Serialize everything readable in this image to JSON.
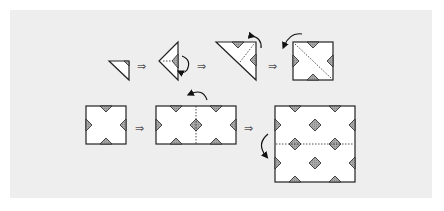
{
  "diagram": {
    "type": "origami-fold-sequence",
    "background_color": "#eeeeee",
    "paper_color": "#ffffff",
    "stroke_color": "#222222",
    "shade_color": "#999999",
    "arrow_glyph": "⇒",
    "rows": [
      {
        "name": "row-1",
        "steps": [
          {
            "id": "step-1",
            "shape": "small-right-triangle",
            "note": "folded triangle unit"
          },
          {
            "id": "step-2",
            "shape": "triangle-pointing-left",
            "note": "rotate/flip",
            "action_icon": "curved-arrow-icon"
          },
          {
            "id": "step-3",
            "shape": "large-right-triangle",
            "note": "unfold",
            "action_icon": "curved-arrow-icon"
          },
          {
            "id": "step-4",
            "shape": "square-with-x",
            "note": "unfolded square with diagonal fold line",
            "action_icon": "curved-arrow-icon"
          }
        ]
      },
      {
        "name": "row-2",
        "steps": [
          {
            "id": "step-5",
            "shape": "square-with-notches"
          },
          {
            "id": "step-6",
            "shape": "double-rectangle",
            "note": "vertical fold line",
            "action_icon": "curved-arrow-icon"
          },
          {
            "id": "step-7",
            "shape": "large-square-pattern",
            "note": "horizontal fold line",
            "action_icon": "curved-arrow-icon"
          }
        ]
      }
    ]
  }
}
